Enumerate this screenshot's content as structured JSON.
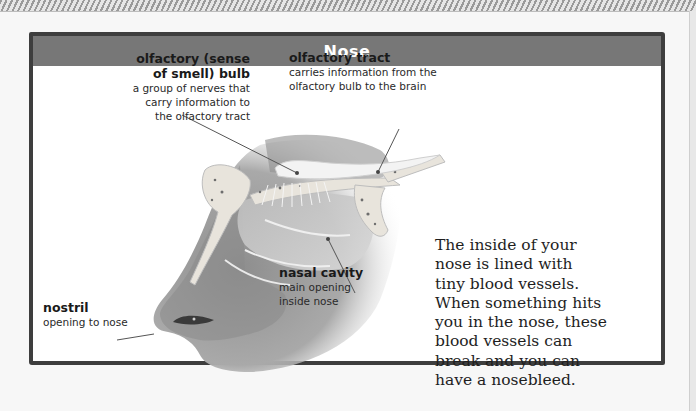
{
  "header": {
    "title": "Nose"
  },
  "labels": {
    "olfactory_bulb": {
      "title_line1": "olfactory (sense",
      "title_line2": "of smell) bulb",
      "desc_line1": "a group of nerves that",
      "desc_line2": "carry information to",
      "desc_line3": "the olfactory tract"
    },
    "olfactory_tract": {
      "title": "olfactory tract",
      "desc_line1": "carries information from the",
      "desc_line2": "olfactory bulb to the brain"
    },
    "nasal_cavity": {
      "title": "nasal cavity",
      "desc_line1": "main opening",
      "desc_line2": "inside nose"
    },
    "nostril": {
      "title": "nostril",
      "desc": "opening to nose"
    }
  },
  "fact": {
    "lines": [
      "The inside of your",
      "nose is lined with",
      "tiny blood vessels.",
      "When something hits",
      "you in the nose, these",
      "blood vessels can",
      "break and you can",
      "have a nosebleed."
    ]
  },
  "colors": {
    "header_band": "#777777",
    "frame_border": "#3e3e3e",
    "page_background": "#f7f7f7",
    "card_background": "#ffffff"
  }
}
